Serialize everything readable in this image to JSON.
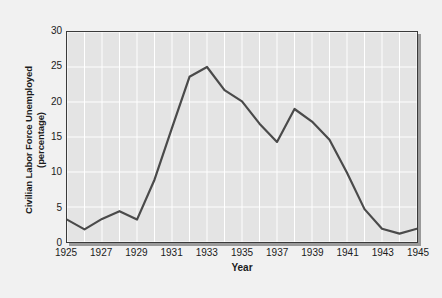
{
  "chart_data": {
    "type": "line",
    "title": "",
    "xlabel": "Year",
    "ylabel_line1": "Civilian Labor Force Unemployed",
    "ylabel_line2": "(percentage)",
    "ylabel": "Civilian Labor Force Unemployed (percentage)",
    "x": [
      1925,
      1926,
      1927,
      1928,
      1929,
      1930,
      1931,
      1932,
      1933,
      1934,
      1935,
      1936,
      1937,
      1938,
      1939,
      1940,
      1941,
      1942,
      1943,
      1944,
      1945
    ],
    "values": [
      3.2,
      1.8,
      3.3,
      4.4,
      3.2,
      8.9,
      16.3,
      23.6,
      25.0,
      21.7,
      20.1,
      16.9,
      14.3,
      19.0,
      17.2,
      14.6,
      9.9,
      4.7,
      1.9,
      1.2,
      1.9
    ],
    "xlim": [
      1925,
      1945
    ],
    "ylim": [
      0,
      30
    ],
    "xticks": [
      1925,
      1927,
      1929,
      1931,
      1933,
      1935,
      1937,
      1939,
      1941,
      1943,
      1945
    ],
    "xtick_labels": [
      "1925",
      "1927",
      "1929",
      "1931",
      "1933",
      "1935",
      "1937",
      "1939",
      "1941",
      "1943",
      "1945"
    ],
    "yticks": [
      0,
      5,
      10,
      15,
      20,
      25,
      30
    ],
    "ytick_labels": [
      "0",
      "5",
      "10",
      "15",
      "20",
      "25",
      "30"
    ],
    "grid": true,
    "grid_color": "#ffffff",
    "grid_x_step": 1,
    "grid_y_step": 5,
    "legend": null,
    "series_color": "#4a4a4a",
    "plot_bg": "#e4e4e4",
    "figure_bg": "#f1f1f1",
    "frame_color": "#3a3a3a"
  }
}
